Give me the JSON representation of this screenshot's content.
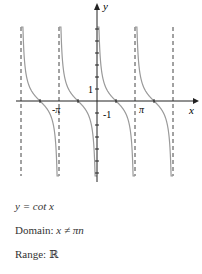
{
  "chart_data": {
    "type": "line",
    "function": "cot",
    "title": "y = cot x",
    "xlabel": "x",
    "ylabel": "y",
    "x_tick_labels": [
      "-π",
      "π"
    ],
    "y_tick_labels": [
      "1",
      "-1"
    ],
    "asymptotes_x": [
      "-2π",
      "-π",
      "π",
      "2π"
    ],
    "xlim": [
      -6.6,
      7.1
    ],
    "ylim": [
      -6.5,
      8
    ],
    "colors": {
      "curve": "#9a9a9a",
      "axis": "#222222",
      "asymptote": "#444444"
    }
  },
  "captions": {
    "equation": "y = cot x",
    "domain_label": "Domain:",
    "domain_value": "x ≠ πn",
    "range_label": "Range:",
    "range_value": "ℝ"
  }
}
